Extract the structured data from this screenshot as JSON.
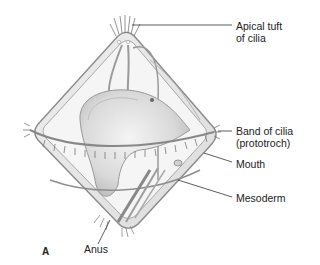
{
  "figure": {
    "panel_letter": "A",
    "labels": [
      {
        "id": "apical-tuft",
        "line1": "Apical tuft",
        "line2": "of cilia"
      },
      {
        "id": "band-of-cilia",
        "line1": "Band of cilia",
        "line2": "(prototroch)"
      },
      {
        "id": "mouth",
        "line1": "Mouth"
      },
      {
        "id": "mesoderm",
        "line1": "Mesoderm"
      },
      {
        "id": "anus",
        "line1": "Anus"
      }
    ],
    "colors": {
      "body_fill": "#e6e6e6",
      "outline": "#8a8a8a",
      "leader_line": "#333333",
      "text": "#222222"
    }
  }
}
